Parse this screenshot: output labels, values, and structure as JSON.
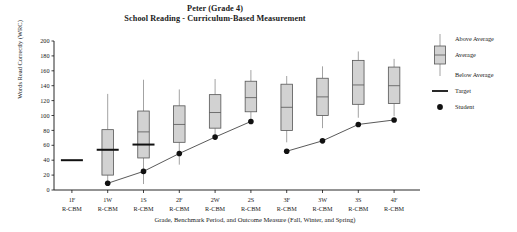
{
  "title": {
    "line1": "Peter (Grade 4)",
    "line2": "School Reading - Curriculum-Based Measurement"
  },
  "caption": "Grade, Benchmark Period, and Outcome Measure (Fall, Winter, and Spring)",
  "legend": {
    "above_average": "Above Average",
    "average": "Average",
    "below_average": "Below Average",
    "target": "Target",
    "student": "Student"
  },
  "colors": {
    "box_fill": "#d2d2d2",
    "box_border": "#555555",
    "whisker": "#999999",
    "median": "#555555",
    "target": "#111111",
    "student": "#111111",
    "axis": "#111111"
  },
  "chart_data": {
    "type": "box",
    "xlabel": "Grade, Benchmark Period, and Outcome Measure (Fall, Winter, and Spring)",
    "ylabel": "Words Read Correctly (WRC)",
    "ylim": [
      0,
      200
    ],
    "yticks": [
      0,
      20,
      40,
      60,
      80,
      100,
      120,
      140,
      160,
      180,
      200
    ],
    "grid": false,
    "legend_position": "right",
    "categories": [
      "1F",
      "1W",
      "1S",
      "2F",
      "2W",
      "2S",
      "3F",
      "3W",
      "3S",
      "4F"
    ],
    "measure_labels": [
      "R-CBM",
      "R-CBM",
      "R-CBM",
      "R-CBM",
      "R-CBM",
      "R-CBM",
      "R-CBM",
      "R-CBM",
      "R-CBM",
      "R-CBM"
    ],
    "boxes": [
      {
        "category": "1F",
        "whisker_low": null,
        "q1": null,
        "median": null,
        "q3": null,
        "whisker_high": null
      },
      {
        "category": "1W",
        "whisker_low": 8,
        "q1": 20,
        "median": 54,
        "q3": 81,
        "whisker_high": 129
      },
      {
        "category": "1S",
        "whisker_low": 8,
        "q1": 43,
        "median": 78,
        "q3": 106,
        "whisker_high": 148
      },
      {
        "category": "2F",
        "whisker_low": 34,
        "q1": 64,
        "median": 88,
        "q3": 113,
        "whisker_high": 135
      },
      {
        "category": "2W",
        "whisker_low": 68,
        "q1": 83,
        "median": 104,
        "q3": 128,
        "whisker_high": 149
      },
      {
        "category": "2S",
        "whisker_low": 90,
        "q1": 105,
        "median": 124,
        "q3": 146,
        "whisker_high": 161
      },
      {
        "category": "3F",
        "whisker_low": 64,
        "q1": 80,
        "median": 111,
        "q3": 142,
        "whisker_high": 153
      },
      {
        "category": "3W",
        "whisker_low": 83,
        "q1": 100,
        "median": 125,
        "q3": 150,
        "whisker_high": 166
      },
      {
        "category": "3S",
        "whisker_low": 97,
        "q1": 115,
        "median": 141,
        "q3": 174,
        "whisker_high": 186
      },
      {
        "category": "4F",
        "whisker_low": 99,
        "q1": 116,
        "median": 140,
        "q3": 165,
        "whisker_high": 176
      }
    ],
    "target_series": {
      "name": "Target",
      "points": [
        {
          "category": "1F",
          "value": 40
        },
        {
          "category": "1W",
          "value": 54
        },
        {
          "category": "1S",
          "value": 61
        }
      ]
    },
    "student_series": {
      "name": "Student",
      "points": [
        {
          "category": "1W",
          "value": 9
        },
        {
          "category": "1S",
          "value": 25
        },
        {
          "category": "2F",
          "value": 49
        },
        {
          "category": "2W",
          "value": 71
        },
        {
          "category": "2S",
          "value": 92
        },
        {
          "category": "3F",
          "value": 52
        },
        {
          "category": "3W",
          "value": 66
        },
        {
          "category": "3S",
          "value": 88
        },
        {
          "category": "4F",
          "value": 94
        }
      ],
      "connected": true,
      "break_after": "2S"
    }
  }
}
